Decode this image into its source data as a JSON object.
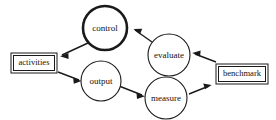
{
  "diagram": {
    "type": "flow-cycle",
    "canvas": {
      "width": 276,
      "height": 120,
      "background": "#ffffff"
    },
    "stroke_color": "#1a1a1a",
    "text_color": "#111111",
    "nodes": [
      {
        "id": "control",
        "label": "control",
        "shape": "circle",
        "emphasis": "thick-border",
        "cx": 105,
        "cy": 28,
        "r": 22,
        "font_size": 9
      },
      {
        "id": "activities",
        "label": "activities",
        "shape": "double-rectangle",
        "emphasis": "normal",
        "x": 11,
        "y": 53,
        "w": 46,
        "h": 20,
        "font_size": 9
      },
      {
        "id": "output",
        "label": "output",
        "shape": "circle",
        "emphasis": "normal",
        "cx": 101,
        "cy": 81,
        "r": 20,
        "font_size": 9
      },
      {
        "id": "measure",
        "label": "measure",
        "shape": "circle",
        "emphasis": "normal",
        "cx": 166,
        "cy": 98,
        "r": 21,
        "font_size": 9
      },
      {
        "id": "evaluate",
        "label": "evaluate",
        "shape": "circle",
        "emphasis": "normal",
        "cx": 169,
        "cy": 55,
        "r": 21,
        "font_size": 9
      },
      {
        "id": "benchmark",
        "label": "benchmark",
        "shape": "double-rectangle",
        "emphasis": "normal",
        "x": 216,
        "y": 64,
        "w": 52,
        "h": 20,
        "font_size": 9
      }
    ],
    "edges": [
      {
        "id": "control-to-activities",
        "from": "control",
        "to": "activities",
        "direction": "down-left",
        "arrowhead": "solid"
      },
      {
        "id": "activities-to-output",
        "from": "activities",
        "to": "output",
        "direction": "down-right",
        "arrowhead": "solid"
      },
      {
        "id": "output-to-measure",
        "from": "output",
        "to": "measure",
        "direction": "down-right",
        "arrowhead": "solid"
      },
      {
        "id": "measure-to-benchmark",
        "from": "measure",
        "to": "benchmark",
        "direction": "up-right",
        "arrowhead": "solid"
      },
      {
        "id": "benchmark-to-evaluate",
        "from": "benchmark",
        "to": "evaluate",
        "direction": "up-left",
        "arrowhead": "solid"
      },
      {
        "id": "evaluate-to-control",
        "from": "evaluate",
        "to": "control",
        "direction": "up-left",
        "arrowhead": "solid"
      }
    ]
  }
}
